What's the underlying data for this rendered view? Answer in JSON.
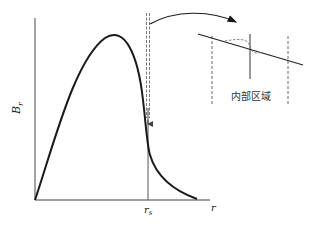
{
  "figure": {
    "type": "diagram",
    "axes": {
      "y_label": "B",
      "y_label_sub": "r",
      "x_label": "r",
      "x_marker_label": "r",
      "x_marker_sub": "s"
    },
    "inset": {
      "label": "内部区域"
    },
    "colors": {
      "curve": "#1a1a1a",
      "axis": "#555555",
      "dashed": "#777777",
      "background": "#ffffff"
    }
  }
}
